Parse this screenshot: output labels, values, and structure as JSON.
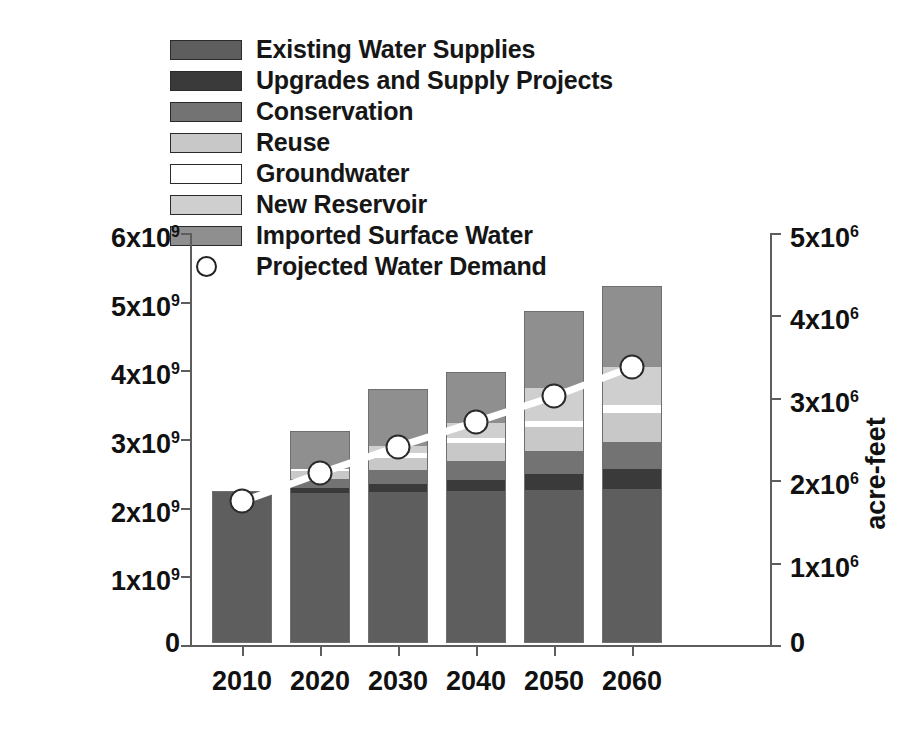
{
  "chart_data": {
    "type": "bar",
    "subtype": "stacked-bar-with-line-overlay",
    "title": "",
    "xlabel": "",
    "ylabel": "cubic meters",
    "ylabel_secondary": "acre-feet",
    "categories": [
      "2010",
      "2020",
      "2030",
      "2040",
      "2050",
      "2060"
    ],
    "ylim": [
      0,
      6000000000
    ],
    "ytick_values": [
      0,
      1000000000,
      2000000000,
      3000000000,
      4000000000,
      5000000000,
      6000000000
    ],
    "ytick_labels": [
      "0",
      "1x10⁹",
      "2x10⁹",
      "3x10⁹",
      "4x10⁹",
      "5x10⁹",
      "6x10⁹"
    ],
    "ylim_secondary": [
      0,
      5000000
    ],
    "ytick_values_secondary": [
      0,
      1000000,
      2000000,
      3000000,
      4000000,
      5000000
    ],
    "ytick_labels_secondary": [
      "0",
      "1x10⁶",
      "2x10⁶",
      "3x10⁶",
      "4x10⁶",
      "5x10⁶"
    ],
    "grid": false,
    "legend_position": "upper-left-outside",
    "series": [
      {
        "name": "Existing Water Supplies",
        "color": "#5e5e5e",
        "values": [
          2220000000,
          2190000000,
          2200000000,
          2210000000,
          2230000000,
          2240000000
        ]
      },
      {
        "name": "Upgrades and Supply Projects",
        "color": "#3a3a3a",
        "values": [
          0,
          70000000,
          120000000,
          170000000,
          230000000,
          290000000
        ]
      },
      {
        "name": "Conservation",
        "color": "#737373",
        "values": [
          0,
          130000000,
          200000000,
          270000000,
          340000000,
          400000000
        ]
      },
      {
        "name": "Reuse",
        "color": "#c8c8c8",
        "values": [
          0,
          110000000,
          180000000,
          260000000,
          340000000,
          420000000
        ]
      },
      {
        "name": "Groundwater",
        "color": "#ffffff",
        "values": [
          0,
          40000000,
          60000000,
          80000000,
          100000000,
          120000000
        ]
      },
      {
        "name": "New Reservoir",
        "color": "#cfcfcf",
        "values": [
          0,
          0,
          110000000,
          220000000,
          480000000,
          550000000
        ]
      },
      {
        "name": "Imported Surface Water",
        "color": "#8f8f8f",
        "values": [
          0,
          550000000,
          830000000,
          730000000,
          1120000000,
          1180000000
        ]
      }
    ],
    "overlay": {
      "name": "Projected Water Demand",
      "marker": "open-circle",
      "line_color": "#ffffff",
      "values": [
        2090000000,
        2500000000,
        2890000000,
        3250000000,
        3620000000,
        4050000000
      ]
    }
  },
  "legend": {
    "items": [
      {
        "label": "Existing Water Supplies",
        "color": "#5e5e5e",
        "type": "swatch"
      },
      {
        "label": "Upgrades and Supply Projects",
        "color": "#3a3a3a",
        "type": "swatch"
      },
      {
        "label": "Conservation",
        "color": "#737373",
        "type": "swatch"
      },
      {
        "label": "Reuse",
        "color": "#c8c8c8",
        "type": "swatch"
      },
      {
        "label": "Groundwater",
        "color": "#ffffff",
        "type": "swatch"
      },
      {
        "label": "New Reservoir",
        "color": "#cfcfcf",
        "type": "swatch"
      },
      {
        "label": "Imported Surface Water",
        "color": "#8f8f8f",
        "type": "swatch"
      },
      {
        "label": "Projected Water Demand",
        "color": "#ffffff",
        "type": "marker"
      }
    ]
  },
  "axes": {
    "left_title": "cubic meters",
    "right_title": "acre-feet"
  }
}
